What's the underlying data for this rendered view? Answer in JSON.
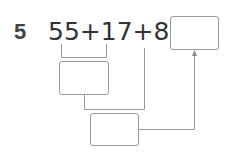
{
  "problem": {
    "number": "5",
    "expression": "55+17+8=",
    "answer_box": "",
    "step1_box": "",
    "step2_box": ""
  }
}
